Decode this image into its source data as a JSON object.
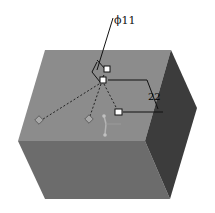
{
  "diagram": {
    "type": "3d-cad-hole-preview",
    "shape": "box",
    "colors": {
      "top_face": "#8a8a8a",
      "front_face": "#6e6e6e",
      "right_face": "#3e3e3e",
      "handle_fill": "#ffffff",
      "dimension_line": "#111111",
      "diamond_fill": "#a8a8a8"
    },
    "dimensions": {
      "diameter": "ϕ11",
      "distance": "22"
    }
  }
}
